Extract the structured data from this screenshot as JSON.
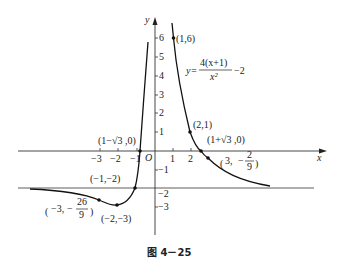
{
  "figure": {
    "caption": "图 4－25",
    "equation": {
      "lhs": "y=",
      "numerator": "4(x+1)",
      "denominator": "x²",
      "tail": "−2"
    },
    "axes": {
      "x_label": "x",
      "y_label": "y",
      "origin_label": "O",
      "x_ticks_pos": [
        "1",
        "2"
      ],
      "x_ticks_neg": [
        "−3",
        "−2",
        "−1"
      ],
      "y_ticks_pos": [
        "6",
        "5",
        "4",
        "3",
        "2",
        "1"
      ],
      "y_ticks_neg": [
        "−1",
        "−2",
        "−3"
      ]
    },
    "points": {
      "p1": "(1,6)",
      "p2": "(2,1)",
      "p3": "(1+√3 ,0)",
      "p4_a": "3,",
      "p4_num": "2",
      "p4_den": "9",
      "p5": "(1−√3 ,0)",
      "p6": "(−1,−2)",
      "p7": "(−2,−3)",
      "p8_a": "−3,",
      "p8_num": "26",
      "p8_den": "9"
    },
    "asymptotes": {
      "horizontal": "y = −2",
      "vertical": "x = 0"
    }
  }
}
